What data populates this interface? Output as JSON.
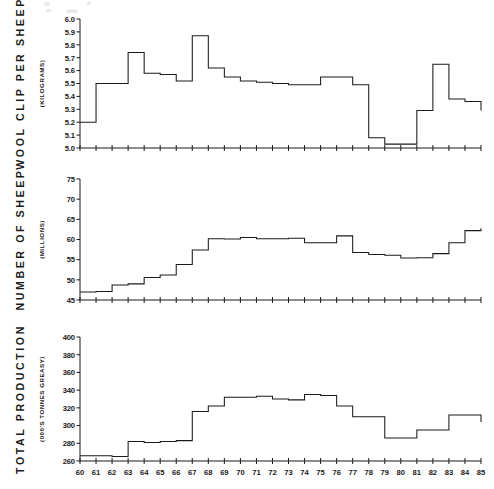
{
  "figure": {
    "name": "australian-wool-statistics-step-charts",
    "background_color": "#ffffff",
    "line_color": "#1a1a1a"
  },
  "x_axis": {
    "label": "",
    "tick_labels": [
      "60",
      "61",
      "62",
      "63",
      "64",
      "65",
      "66",
      "67",
      "68",
      "69",
      "70",
      "71",
      "72",
      "73",
      "74",
      "75",
      "76",
      "77",
      "78",
      "79",
      "80",
      "81",
      "82",
      "83",
      "84",
      "85"
    ],
    "min": 60,
    "max": 85
  },
  "chart_data": [
    {
      "type": "line",
      "subtype": "step",
      "id": "wool-clip-per-sheep",
      "title": "WOOL CLIP PER SHEEP",
      "subtitle": "(KILOGRAMS)",
      "ylabel": "WOOL CLIP PER SHEEP",
      "ylabel_units": "(KILOGRAMS)",
      "xlabel": "",
      "ylim": [
        5.0,
        6.0
      ],
      "ytick_labels": [
        "6.0",
        "5.9",
        "5.8",
        "5.7",
        "5.6",
        "5.5",
        "5.4",
        "5.3",
        "5.2",
        "5.1",
        "5.0"
      ],
      "yticks": [
        6.0,
        5.9,
        5.8,
        5.7,
        5.6,
        5.5,
        5.4,
        5.3,
        5.2,
        5.1,
        5.0
      ],
      "xlim": [
        60,
        85
      ],
      "grid": false,
      "legend": false,
      "x": [
        60,
        61,
        62,
        63,
        64,
        65,
        66,
        67,
        68,
        69,
        70,
        71,
        72,
        73,
        74,
        75,
        76,
        77,
        78,
        79,
        80,
        81,
        82,
        83,
        84,
        85
      ],
      "values": [
        5.2,
        5.5,
        5.5,
        5.74,
        5.58,
        5.57,
        5.52,
        5.87,
        5.62,
        5.55,
        5.52,
        5.51,
        5.5,
        5.49,
        5.49,
        5.55,
        5.55,
        5.49,
        5.08,
        5.03,
        5.03,
        5.29,
        5.65,
        5.38,
        5.36,
        5.29
      ]
    },
    {
      "type": "line",
      "subtype": "step",
      "id": "number-of-sheep",
      "title": "NUMBER OF SHEEP",
      "subtitle": "(MILLIONS)",
      "ylabel": "NUMBER OF SHEEP",
      "ylabel_units": "(MILLIONS)",
      "xlabel": "",
      "ylim": [
        45,
        75
      ],
      "ytick_labels": [
        "75",
        "70",
        "65",
        "60",
        "55",
        "50",
        "45"
      ],
      "yticks": [
        75,
        70,
        65,
        60,
        55,
        50,
        45
      ],
      "xlim": [
        60,
        85
      ],
      "grid": false,
      "legend": false,
      "x": [
        60,
        61,
        62,
        63,
        64,
        65,
        66,
        67,
        68,
        69,
        70,
        71,
        72,
        73,
        74,
        75,
        76,
        77,
        78,
        79,
        80,
        81,
        82,
        83,
        84,
        85
      ],
      "values": [
        47.0,
        47.1,
        48.7,
        49.0,
        50.6,
        51.2,
        53.8,
        57.4,
        60.2,
        60.1,
        60.5,
        60.2,
        60.2,
        60.3,
        59.2,
        59.2,
        60.9,
        56.8,
        56.3,
        56.1,
        55.4,
        55.5,
        56.5,
        59.2,
        62.2,
        62.8
      ]
    },
    {
      "type": "line",
      "subtype": "step",
      "id": "total-production",
      "title": "TOTAL PRODUCTION",
      "subtitle": "(000'S TONNES GREASY)",
      "ylabel": "TOTAL PRODUCTION",
      "ylabel_units": "(000'S TONNES GREASY)",
      "xlabel": "",
      "ylim": [
        260,
        400
      ],
      "ytick_labels": [
        "400",
        "380",
        "360",
        "340",
        "320",
        "300",
        "280",
        "260"
      ],
      "yticks": [
        400,
        380,
        360,
        340,
        320,
        300,
        280,
        260
      ],
      "xlim": [
        60,
        85
      ],
      "grid": false,
      "legend": false,
      "x": [
        60,
        61,
        62,
        63,
        64,
        65,
        66,
        67,
        68,
        69,
        70,
        71,
        72,
        73,
        74,
        75,
        76,
        77,
        78,
        79,
        80,
        81,
        82,
        83,
        84,
        85
      ],
      "values": [
        266,
        266,
        265,
        282,
        281,
        282,
        283,
        316,
        322,
        332,
        332,
        333,
        330,
        329,
        335,
        334,
        322,
        310,
        310,
        286,
        286,
        295,
        295,
        312,
        312,
        304
      ]
    }
  ],
  "chart_series_tail": {
    "wool-clip-per-sheep_tail": [
      5.63,
      5.56,
      5.56,
      5.21,
      5.21,
      5.3,
      5.3,
      5.19,
      5.19,
      5.37,
      5.37
    ],
    "number-of-sheep_tail": [
      63.7,
      68.9,
      68.9,
      70.1,
      70.1,
      70.3,
      70.3,
      70.3,
      70.0,
      70.0,
      70.0
    ],
    "total-production_tail": [
      304,
      312,
      321,
      357,
      357,
      381,
      381,
      364,
      372,
      372,
      365,
      375,
      375
    ]
  }
}
